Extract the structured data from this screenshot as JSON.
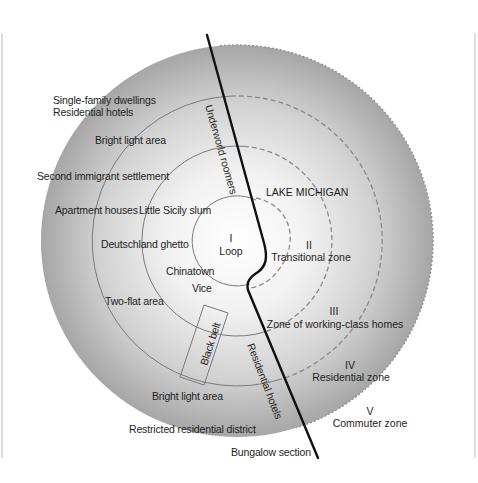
{
  "diagram": {
    "colors": {
      "disk_outer": "#a9a9a9",
      "disk_center": "#ffffff",
      "ring_line": "#7a7a7a",
      "divider": "#111111",
      "frame": "#cfcfcf",
      "text": "#1e1e1e"
    },
    "zones": [
      {
        "numeral": "I",
        "name": "Loop"
      },
      {
        "numeral": "II",
        "name": "Transitional zone"
      },
      {
        "numeral": "III",
        "name": "Zone of working-class homes"
      },
      {
        "numeral": "IV",
        "name": "Residential zone"
      },
      {
        "numeral": "V",
        "name": "Commuter zone"
      }
    ],
    "lake_label": "LAKE MICHIGAN",
    "left_labels": {
      "single_family": "Single-family dwellings",
      "residential_hotels": "Residential hotels",
      "bright_light_top": "Bright light area",
      "second_immigrant": "Second immigrant settlement",
      "apartment_houses": "Apartment houses",
      "little_sicily": "Little Sicily slum",
      "deutschland": "Deutschland ghetto",
      "chinatown": "Chinatown",
      "vice": "Vice",
      "two_flat": "Two-flat area",
      "black_belt": "Black belt",
      "bright_light_bottom": "Bright light area",
      "restricted": "Restricted residential district",
      "bungalow": "Bungalow section"
    },
    "divider_labels": {
      "underworld": "Underworld roomers",
      "residential_hotels": "Residential hotels"
    }
  }
}
